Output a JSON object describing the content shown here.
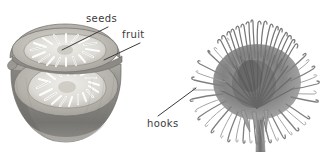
{
  "figure": {
    "background_color": "#ffffff",
    "width": 324,
    "height": 152,
    "ink_color": "#3a3a3a"
  },
  "labels": {
    "seeds": "seeds",
    "fruit": "fruit",
    "hooks": "hooks"
  },
  "illustrations": {
    "left": {
      "name": "fruit-cross-section",
      "description": "Grayscale drawing of a rounded fruit cut open showing two seed chambers",
      "rind_color": "#8f8f8f",
      "flesh_color": "#b9b7b2",
      "seed_color": "#efeeea"
    },
    "right": {
      "name": "burr-with-hooks",
      "description": "Grayscale drawing of a spiny burr seed head on a stem with many hooked bristles",
      "bristle_color": "#7d7d7d",
      "core_color": "#9a9a9a",
      "stem_color": "#8a8a8a"
    }
  },
  "leader_lines": {
    "seeds": {
      "from_x": 62,
      "from_y": 50,
      "to_x": 108,
      "to_y": 27
    },
    "fruit": {
      "from_x": 104,
      "from_y": 60,
      "to_x": 140,
      "to_y": 43
    },
    "hooks": {
      "from_x": 158,
      "from_y": 116,
      "to_x": 196,
      "to_y": 88
    }
  }
}
